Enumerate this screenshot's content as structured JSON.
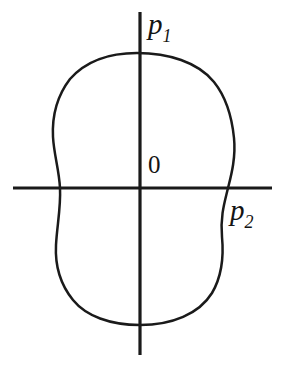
{
  "figure": {
    "kind": "math-diagram",
    "background_color": "#ffffff",
    "stroke_color": "#1a1a1a",
    "labels": {
      "vertical_axis": {
        "variable": "p",
        "subscript": "1"
      },
      "horizontal_axis": {
        "variable": "p",
        "subscript": "2"
      },
      "origin": "0"
    },
    "axes": {
      "horizontal": {
        "y": 188,
        "x_start": 13,
        "x_end": 272
      },
      "vertical": {
        "x": 140,
        "y_start": 12,
        "y_end": 355
      }
    }
  },
  "chart_data": {
    "type": "line",
    "title": "",
    "xlabel": "p2",
    "ylabel": "p1",
    "grid": false,
    "legend": false,
    "annotations": [
      {
        "text": "0",
        "x": 148,
        "y": 152,
        "role": "origin-label"
      },
      {
        "text": "p1",
        "x": 148,
        "y": 10,
        "role": "vertical-axis-label"
      },
      {
        "text": "p2",
        "x": 230,
        "y": 196,
        "role": "horizontal-axis-label"
      }
    ],
    "series": [
      {
        "name": "closed-region-boundary",
        "closed": true,
        "fill": "none",
        "path": "M 137 53 C 168 53 198 62 214 82 C 226 97 232 118 234 138 C 236 158 231 176 228 188 C 225 201 220 216 222 237 C 224 258 222 276 212 293 C 199 314 172 325 140 325 C 110 325 86 316 73 300 C 60 284 55 264 56 245 C 57 226 61 207 60 188 C 59 169 54 155 53 137 C 52 117 57 96 70 79 C 86 61 110 53 137 53 Z",
        "extents": {
          "top": {
            "x": 137,
            "y": 53
          },
          "bottom": {
            "x": 140,
            "y": 325
          },
          "left_waist": {
            "x": 60,
            "y": 188
          },
          "right_waist": {
            "x": 228,
            "y": 188
          },
          "upper_left": {
            "x": 53,
            "y": 137
          },
          "upper_right": {
            "x": 234,
            "y": 138
          },
          "lower_left": {
            "x": 56,
            "y": 245
          },
          "lower_right": {
            "x": 222,
            "y": 237
          }
        }
      }
    ]
  }
}
